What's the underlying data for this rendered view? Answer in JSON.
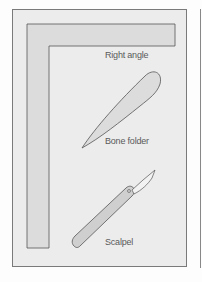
{
  "diagram": {
    "tools": [
      {
        "id": "right-angle",
        "label": "Right angle"
      },
      {
        "id": "bone-folder",
        "label": "Bone folder"
      },
      {
        "id": "scalpel",
        "label": "Scalpel"
      }
    ],
    "colors": {
      "frame_fill": "#ececec",
      "tool_fill": "#dcdcdc",
      "outline": "#555555",
      "label": "#5a5a5a"
    }
  }
}
